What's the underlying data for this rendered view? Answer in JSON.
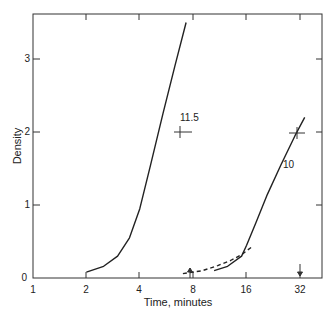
{
  "chart_data": {
    "type": "line",
    "title": "",
    "xlabel": "Time, minutes",
    "ylabel": "Density",
    "xscale": "log2",
    "xlim": [
      1,
      40
    ],
    "ylim": [
      0,
      3.6
    ],
    "x_ticks": [
      "1",
      "2",
      "4",
      "8",
      "16",
      "32"
    ],
    "y_ticks": [
      "0",
      "1",
      "2",
      "3"
    ],
    "grid": false,
    "legend": "none",
    "series": [
      {
        "name": "11.5",
        "style": "solid",
        "x": [
          2.0,
          2.5,
          3.0,
          3.5,
          4.0,
          4.6,
          5.4,
          6.3,
          7.3
        ],
        "y": [
          0.08,
          0.16,
          0.3,
          0.55,
          0.95,
          1.55,
          2.25,
          2.9,
          3.5
        ]
      },
      {
        "name": "10",
        "style": "solid",
        "x": [
          10.5,
          12.5,
          15.0,
          16.0,
          18.0,
          21.0,
          25.0,
          30.0,
          34.0
        ],
        "y": [
          0.1,
          0.16,
          0.3,
          0.45,
          0.75,
          1.15,
          1.55,
          1.95,
          2.2
        ]
      },
      {
        "name": "dashed",
        "style": "dashed",
        "x": [
          7.0,
          9.0,
          11.0,
          13.0,
          15.0,
          17.0
        ],
        "y": [
          0.06,
          0.1,
          0.17,
          0.24,
          0.32,
          0.42
        ]
      }
    ],
    "annotations": [
      {
        "text": "11.5",
        "x": 5.2,
        "y": 2.1
      },
      {
        "text": "10",
        "x": 28.0,
        "y": 1.55
      },
      {
        "text": "cross marker",
        "x": 4.85,
        "y": 2.0
      },
      {
        "text": "cross marker",
        "x": 31.5,
        "y": 1.98
      },
      {
        "text": "arrow",
        "x": 7.8,
        "y": 0
      },
      {
        "text": "arrow",
        "x": 32.0,
        "y": 0
      }
    ]
  }
}
